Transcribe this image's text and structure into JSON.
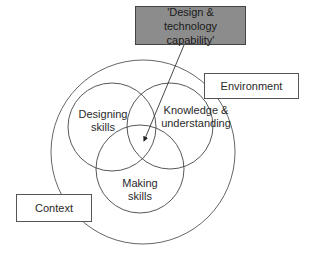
{
  "diagram": {
    "title_box": {
      "line1": "'Design & technology",
      "line2": "capability'",
      "fill_color": "#8c8c8c"
    },
    "outer_labels": {
      "environment": "Environment",
      "context": "Context"
    },
    "circles": {
      "designing": {
        "line1": "Designing",
        "line2": "skills"
      },
      "knowledge": {
        "line1": "Knowledge &",
        "line2": "understanding"
      },
      "making": {
        "line1": "Making",
        "line2": "skills"
      }
    },
    "arrow": {
      "from": "title_box",
      "to": "intersection_of_all_three_circles"
    }
  }
}
